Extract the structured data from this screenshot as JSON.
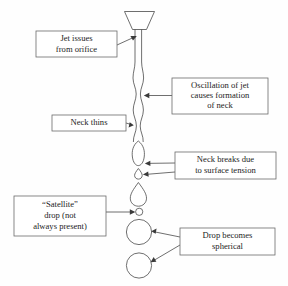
{
  "figure": {
    "background_color": "#fefefe",
    "line_color": "#4a4a4a",
    "box_border_color": "#6b6b6b",
    "text_color": "#1c1c1c"
  },
  "callouts": [
    {
      "id": "jet-issues",
      "lines": [
        "Jet issues",
        "from orifice"
      ],
      "box": {
        "x": 36,
        "y": 31,
        "w": 81,
        "h": 26
      }
    },
    {
      "id": "oscillation",
      "lines": [
        "Oscillation of jet",
        "causes formation",
        "of neck"
      ],
      "box": {
        "x": 172,
        "y": 78,
        "w": 96,
        "h": 36
      }
    },
    {
      "id": "neck-thins",
      "lines": [
        "Neck thins"
      ],
      "box": {
        "x": 52,
        "y": 115,
        "w": 74,
        "h": 16
      }
    },
    {
      "id": "neck-breaks",
      "lines": [
        "Neck breaks due",
        "to surface tension"
      ],
      "box": {
        "x": 175,
        "y": 152,
        "w": 101,
        "h": 27
      }
    },
    {
      "id": "satellite-drop",
      "lines": [
        "“Satellite”",
        "drop (not",
        "always present)"
      ],
      "box": {
        "x": 14,
        "y": 196,
        "w": 92,
        "h": 40
      }
    },
    {
      "id": "drop-spherical",
      "lines": [
        "Drop becomes",
        "spherical"
      ],
      "box": {
        "x": 180,
        "y": 228,
        "w": 95,
        "h": 27
      }
    }
  ],
  "shapes": [
    {
      "id": "nozzle",
      "kind": "funnel",
      "label": "orifice-nozzle"
    },
    {
      "id": "jet-column",
      "kind": "wavy-jet",
      "label": "liquid-jet"
    },
    {
      "id": "pinched-blob",
      "kind": "ellipse-blob",
      "label": "detaching-blob"
    },
    {
      "id": "tiny-droplet",
      "kind": "teardrop-small",
      "label": "small-teardrop"
    },
    {
      "id": "main-teardrop",
      "kind": "teardrop-large",
      "label": "large-teardrop"
    },
    {
      "id": "satellite-circle",
      "kind": "circle",
      "label": "satellite-droplet"
    },
    {
      "id": "drop-circle-1",
      "kind": "circle",
      "label": "spherical-drop-upper"
    },
    {
      "id": "drop-circle-2",
      "kind": "circle",
      "label": "spherical-drop-lower"
    }
  ]
}
